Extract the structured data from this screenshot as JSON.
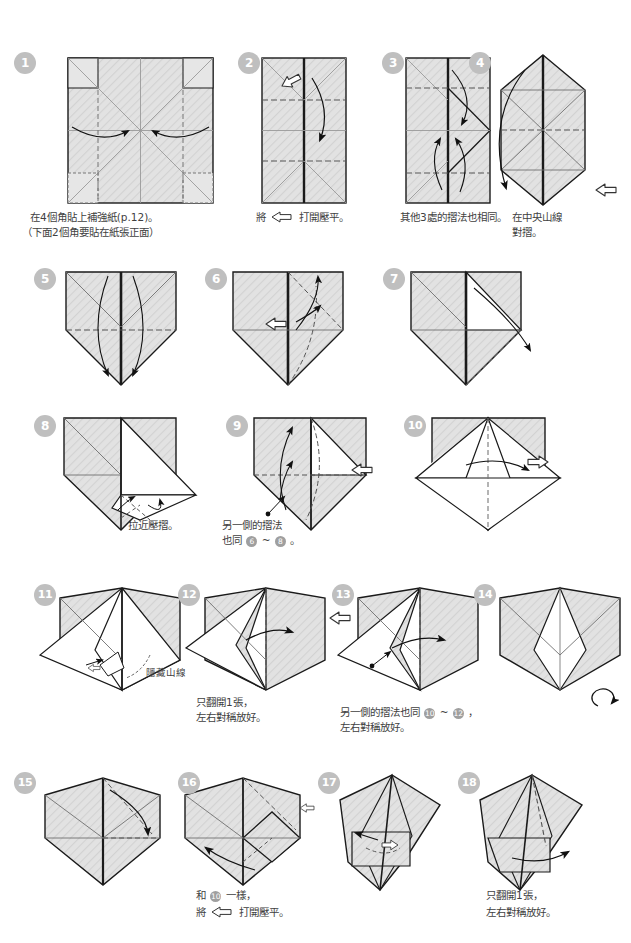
{
  "page": {
    "background": "#ffffff",
    "width": 631,
    "height": 943
  },
  "palette": {
    "paper_front": "#dcdcdc",
    "paper_back": "#ffffff",
    "outline": "#1a1a1a",
    "crease_valley": "#555555",
    "crease_fine": "#8d8d8d",
    "badge_bg": "#bfbfbf",
    "badge_text": "#ffffff",
    "text": "#3f3f3f"
  },
  "legend": {
    "hollow_arrow_icon": "open-here-arrow-icon",
    "solid_arrow_icon": "fold-direction-arrow-icon",
    "dashed_line": "valley-fold-line",
    "dotted_line": "hidden-mountain-line",
    "loop_arrow_icon": "turn-over-icon"
  },
  "steps": [
    {
      "number": "1",
      "caption_lines": [
        "在4個角貼上補強紙(p.12)。",
        "（下面2個角要貼在紙張正面）"
      ],
      "icons": [
        "fold-direction-arrow-icon"
      ],
      "inline_refs": []
    },
    {
      "number": "2",
      "caption_lines": [
        "將 ⇨ 打開壓平。"
      ],
      "caption_prefix": "將",
      "caption_suffix": "打開壓平。",
      "icons": [
        "open-here-arrow-icon",
        "fold-direction-arrow-icon"
      ],
      "inline_refs": []
    },
    {
      "number": "3",
      "caption_lines": [
        "其他3處的摺法也相同。"
      ],
      "icons": [
        "fold-direction-arrow-icon"
      ],
      "inline_refs": []
    },
    {
      "number": "4",
      "caption_lines": [
        "在中央山線",
        "對摺。"
      ],
      "icons": [
        "fold-direction-arrow-icon",
        "open-here-arrow-icon"
      ],
      "inline_refs": []
    },
    {
      "number": "5",
      "caption_lines": [],
      "icons": [
        "fold-direction-arrow-icon"
      ],
      "inline_refs": []
    },
    {
      "number": "6",
      "caption_lines": [],
      "icons": [
        "open-here-arrow-icon",
        "fold-direction-arrow-icon"
      ],
      "inline_refs": []
    },
    {
      "number": "7",
      "caption_lines": [],
      "icons": [
        "fold-direction-arrow-icon"
      ],
      "inline_refs": []
    },
    {
      "number": "8",
      "caption_lines": [
        "拉近壓摺。"
      ],
      "icons": [
        "fold-direction-arrow-icon"
      ],
      "inline_refs": []
    },
    {
      "number": "9",
      "caption_lines": [
        "另一側的摺法",
        "也同 6 ~ 8 。"
      ],
      "caption_line1": "另一側的摺法",
      "caption_line2_prefix": "也同",
      "caption_line2_mid": "~",
      "caption_line2_suffix": "。",
      "icons": [
        "open-here-arrow-icon",
        "fold-direction-arrow-icon"
      ],
      "inline_refs": [
        "6",
        "8"
      ]
    },
    {
      "number": "10",
      "caption_lines": [],
      "icons": [
        "open-here-arrow-icon",
        "fold-direction-arrow-icon"
      ],
      "inline_refs": []
    },
    {
      "number": "11",
      "caption_lines": [],
      "label": "隱藏山線",
      "icons": [
        "open-here-arrow-icon",
        "fold-direction-arrow-icon"
      ],
      "inline_refs": []
    },
    {
      "number": "12",
      "caption_lines": [
        "只翻開1張，",
        "左右對稱放好。"
      ],
      "icons": [
        "fold-direction-arrow-icon"
      ],
      "inline_refs": []
    },
    {
      "number": "13",
      "caption_lines": [
        "另一側的摺法也同 10 ~ 12 ，",
        "左右對稱放好。"
      ],
      "caption_line1_prefix": "另一側的摺法也同",
      "caption_line1_mid": "~",
      "caption_line1_suffix": "，",
      "caption_line2": "左右對稱放好。",
      "icons": [
        "open-here-arrow-icon",
        "fold-direction-arrow-icon"
      ],
      "inline_refs": [
        "10",
        "12"
      ]
    },
    {
      "number": "14",
      "caption_lines": [],
      "icons": [
        "turn-over-icon"
      ],
      "inline_refs": []
    },
    {
      "number": "15",
      "caption_lines": [],
      "icons": [
        "fold-direction-arrow-icon"
      ],
      "inline_refs": []
    },
    {
      "number": "16",
      "caption_lines": [
        "和 10 一樣，",
        "將 ⇨ 打開壓平。"
      ],
      "caption_line1_prefix": "和",
      "caption_line1_suffix": "一樣，",
      "caption_line2_prefix": "將",
      "caption_line2_suffix": "打開壓平。",
      "icons": [
        "open-here-arrow-icon",
        "fold-direction-arrow-icon"
      ],
      "inline_refs": [
        "10"
      ]
    },
    {
      "number": "17",
      "caption_lines": [],
      "icons": [
        "open-here-arrow-icon",
        "fold-direction-arrow-icon"
      ],
      "inline_refs": []
    },
    {
      "number": "18",
      "caption_lines": [
        "只翻開1張，",
        "左右對稱放好。"
      ],
      "icons": [
        "fold-direction-arrow-icon"
      ],
      "inline_refs": []
    }
  ]
}
